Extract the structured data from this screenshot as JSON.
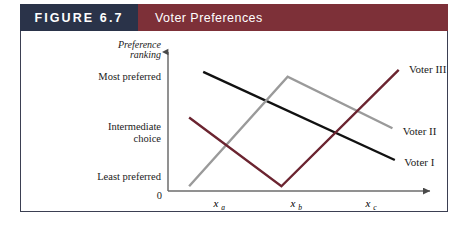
{
  "header": {
    "figure_number": "FIGURE 6.7",
    "title": "Voter Preferences",
    "number_block_color": "#2a3349",
    "title_block_color": "#7d3038"
  },
  "chart_data": {
    "type": "line",
    "title": "Voter Preferences",
    "xlabel": "",
    "ylabel": "Preference ranking",
    "y_axis_label_line1": "Preference",
    "y_axis_label_line2": "ranking",
    "origin_label": "0",
    "grid": false,
    "legend_position": "inline-right-of-line-ends",
    "x_tick_labels": [
      "xa",
      "xb",
      "xc"
    ],
    "x_tick_base": [
      "x",
      "x",
      "x"
    ],
    "x_tick_sub": [
      "a",
      "b",
      "c"
    ],
    "x_tick_positions": [
      1,
      2,
      3
    ],
    "y_tick_labels": [
      "Most preferred",
      "Intermediate choice",
      "Least preferred"
    ],
    "y_tick_label_parts": [
      [
        "Most preferred"
      ],
      [
        "Intermediate",
        "choice"
      ],
      [
        "Least preferred"
      ]
    ],
    "y_tick_values": [
      3,
      2,
      1
    ],
    "xlim": [
      0.55,
      3.9
    ],
    "ylim": [
      0,
      3.5
    ],
    "series": [
      {
        "name": "Voter I",
        "label": "Voter I",
        "color": "#111111",
        "x": [
          1.0,
          3.45
        ],
        "y": [
          3.0,
          0.78
        ],
        "shape": "monotonically decreasing",
        "label_x": 3.52,
        "label_y": 0.72
      },
      {
        "name": "Voter II",
        "label": "Voter II",
        "color": "#9a9a9a",
        "x": [
          0.82,
          2.08,
          3.42
        ],
        "y": [
          0.12,
          2.88,
          1.58
        ],
        "shape": "single peaked",
        "label_x": 3.5,
        "label_y": 1.52
      },
      {
        "name": "Voter III",
        "label": "Voter III",
        "color": "#6b2430",
        "x": [
          0.82,
          2.0,
          3.5
        ],
        "y": [
          1.85,
          0.12,
          3.05
        ],
        "shape": "double peaked (V shaped)",
        "label_x": 3.58,
        "label_y": 3.08
      }
    ]
  }
}
